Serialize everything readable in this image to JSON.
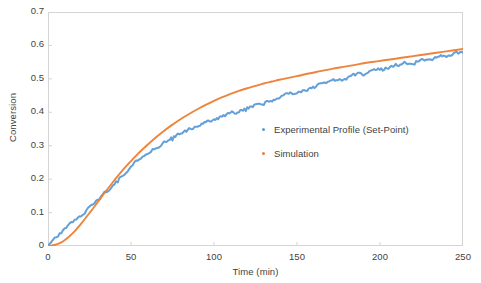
{
  "chart_data": {
    "type": "line",
    "title": "",
    "xlabel": "Time (min)",
    "ylabel": "Conversion",
    "xlim": [
      0,
      250
    ],
    "ylim": [
      0,
      0.7
    ],
    "grid": false,
    "legend_position": "inside-center-right",
    "xticks": [
      "0",
      "50",
      "100",
      "150",
      "200",
      "250"
    ],
    "xtick_values": [
      0,
      50,
      100,
      150,
      200,
      250
    ],
    "yticks": [
      "0",
      "0.1",
      "0.2",
      "0.3",
      "0.4",
      "0.5",
      "0.6",
      "0.7"
    ],
    "ytick_values": [
      0,
      0.1,
      0.2,
      0.3,
      0.4,
      0.5,
      0.6,
      0.7
    ],
    "colors": {
      "experimental": "#5B9BD5",
      "simulation": "#ED7D31",
      "frame": "#D4D4D4",
      "text": "#3F3F3F",
      "background": "#FFFFFF"
    },
    "series": [
      {
        "name": "Experimental Profile (Set-Point)",
        "color": "#5B9BD5",
        "noisy": true,
        "x": [
          0,
          2,
          4,
          6,
          8,
          10,
          12,
          14,
          16,
          18,
          20,
          23,
          26,
          29,
          32,
          35,
          38,
          41,
          44,
          47,
          50,
          54,
          58,
          62,
          66,
          70,
          75,
          80,
          85,
          90,
          95,
          100,
          105,
          110,
          115,
          120,
          125,
          130,
          135,
          140,
          145,
          150,
          157,
          164,
          171,
          178,
          185,
          192,
          199,
          206,
          213,
          220,
          227,
          234,
          241,
          248,
          250
        ],
        "y": [
          0.002,
          0.012,
          0.022,
          0.031,
          0.04,
          0.048,
          0.057,
          0.066,
          0.075,
          0.083,
          0.092,
          0.106,
          0.12,
          0.134,
          0.148,
          0.163,
          0.178,
          0.193,
          0.208,
          0.223,
          0.238,
          0.256,
          0.272,
          0.287,
          0.3,
          0.312,
          0.325,
          0.337,
          0.348,
          0.358,
          0.368,
          0.378,
          0.387,
          0.396,
          0.404,
          0.412,
          0.42,
          0.428,
          0.436,
          0.444,
          0.452,
          0.46,
          0.471,
          0.481,
          0.491,
          0.5,
          0.509,
          0.518,
          0.527,
          0.535,
          0.543,
          0.551,
          0.558,
          0.565,
          0.572,
          0.578,
          0.58
        ]
      },
      {
        "name": "Simulation",
        "color": "#ED7D31",
        "noisy": false,
        "x": [
          0,
          2,
          4,
          6,
          8,
          10,
          12,
          14,
          16,
          18,
          20,
          23,
          26,
          29,
          32,
          35,
          38,
          41,
          44,
          47,
          50,
          54,
          58,
          62,
          66,
          70,
          75,
          80,
          85,
          90,
          95,
          100,
          105,
          110,
          115,
          120,
          125,
          130,
          135,
          140,
          145,
          150,
          157,
          164,
          171,
          178,
          185,
          192,
          199,
          206,
          213,
          220,
          227,
          234,
          241,
          248,
          250
        ],
        "y": [
          0.0,
          0.001,
          0.003,
          0.006,
          0.011,
          0.017,
          0.025,
          0.034,
          0.044,
          0.055,
          0.067,
          0.086,
          0.105,
          0.125,
          0.145,
          0.165,
          0.184,
          0.203,
          0.221,
          0.238,
          0.254,
          0.275,
          0.294,
          0.312,
          0.329,
          0.345,
          0.363,
          0.38,
          0.395,
          0.409,
          0.422,
          0.434,
          0.445,
          0.455,
          0.464,
          0.472,
          0.479,
          0.486,
          0.492,
          0.498,
          0.503,
          0.508,
          0.516,
          0.523,
          0.53,
          0.536,
          0.542,
          0.548,
          0.553,
          0.558,
          0.563,
          0.568,
          0.573,
          0.578,
          0.583,
          0.588,
          0.59
        ]
      }
    ]
  },
  "legend": {
    "items": [
      {
        "label": "Experimental Profile (Set-Point)",
        "color": "#5B9BD5"
      },
      {
        "label": "Simulation",
        "color": "#ED7D31"
      }
    ]
  }
}
